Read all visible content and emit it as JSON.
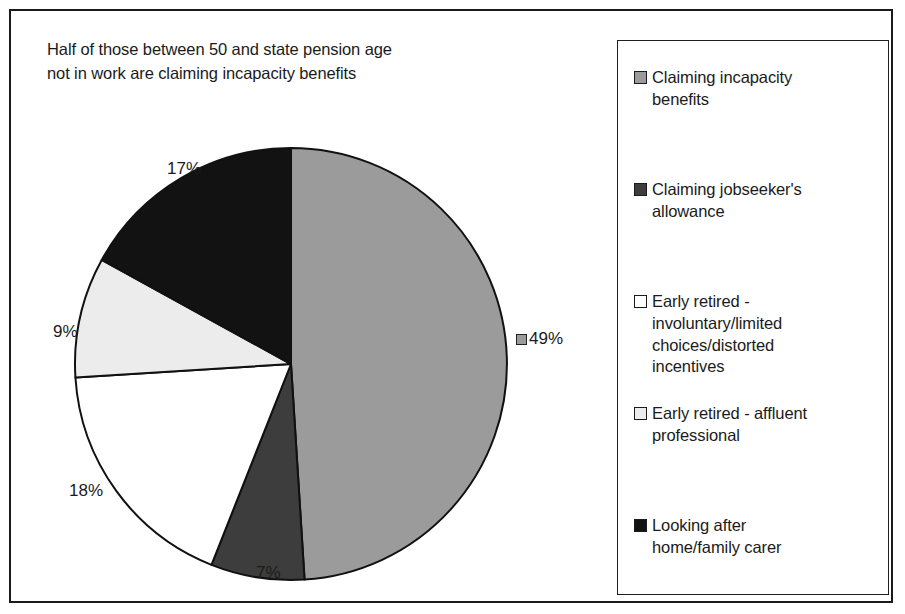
{
  "chart_data": {
    "type": "pie",
    "title": "Half of those between 50 and state pension age\nnot in work are claiming incapacity benefits",
    "categories": [
      "Claiming incapacity benefits",
      "Claiming jobseeker's allowance",
      "Early retired - involuntary/limited choices/distorted incentives",
      "Early retired - affluent professional",
      "Looking after home/family carer"
    ],
    "values": [
      49,
      7,
      18,
      9,
      17
    ],
    "value_labels": [
      "49%",
      "7%",
      "18%",
      "9%",
      "17%"
    ],
    "colors": [
      "#9b9b9b",
      "#3d3d3d",
      "#ffffff",
      "#ececec",
      "#121212"
    ],
    "slice_border_color": "#111111",
    "start_angle_deg": 0,
    "direction": "clockwise",
    "legend_position": "right",
    "grid": false,
    "xlabel": "",
    "ylabel": ""
  },
  "title": {
    "line1": "Half of those between 50 and state pension age",
    "line2": "not in work are claiming incapacity benefits",
    "text": "Half of those between 50 and state pension age\nnot in work are claiming incapacity benefits"
  },
  "pie_labels": [
    {
      "id": "49",
      "text": "49%",
      "has_swatch": true,
      "swatch_color": "#9b9b9b"
    },
    {
      "id": "7",
      "text": "7%",
      "has_swatch": false,
      "swatch_color": "#3d3d3d"
    },
    {
      "id": "18",
      "text": "18%",
      "has_swatch": false,
      "swatch_color": "#ffffff"
    },
    {
      "id": "9",
      "text": "9%",
      "has_swatch": false,
      "swatch_color": "#ececec"
    },
    {
      "id": "17",
      "text": "17%",
      "has_swatch": false,
      "swatch_color": "#121212"
    }
  ],
  "legend": {
    "items": [
      {
        "label": "Claiming incapacity\nbenefits",
        "color": "#9b9b9b"
      },
      {
        "label": "Claiming jobseeker's\nallowance",
        "color": "#3d3d3d"
      },
      {
        "label": "Early retired -\ninvoluntary/limited\nchoices/distorted\nincentives",
        "color": "#ffffff"
      },
      {
        "label": "Early retired - affluent\nprofessional",
        "color": "#ececec"
      },
      {
        "label": "Looking after\nhome/family carer",
        "color": "#121212"
      }
    ]
  }
}
